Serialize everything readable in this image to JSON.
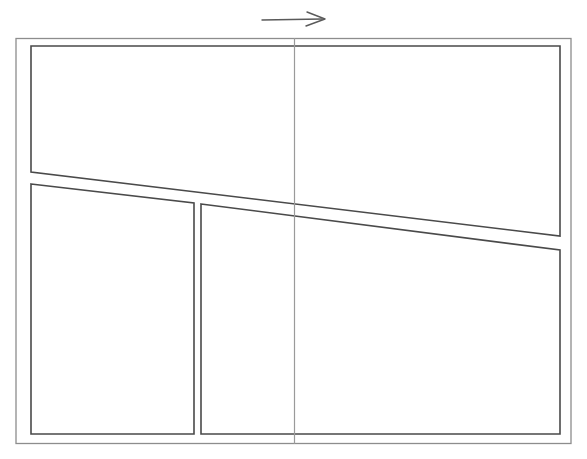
{
  "figure": {
    "title": "Panel layout line diagram",
    "background_color": "#ffffff",
    "line_color": "#4a4a4a",
    "frame_color": "#8d8d8d",
    "center_line_color": "#9a9a9a",
    "width": 587,
    "height": 459
  },
  "annotation": {
    "arrow": {
      "name": "direction-arrow",
      "label": "",
      "direction": "right",
      "start_x": 262,
      "start_y": 20,
      "end_x": 325,
      "end_y": 19,
      "color": "#5a5a5a"
    }
  },
  "outer_frame": {
    "name": "outer-frame",
    "x": 16,
    "y": 38,
    "width": 555,
    "height": 406,
    "color": "#8d8d8d"
  },
  "center_line": {
    "name": "vertical-center-line",
    "x": 294,
    "y_top": 38,
    "y_bottom": 444,
    "color": "#9a9a9a"
  },
  "panels": [
    {
      "id": "upper-panel",
      "name": "upper-panel",
      "shape": "quadrilateral",
      "points": "31,46 560,46 560,236 31,172",
      "color": "#4a4a4a"
    },
    {
      "id": "lower-left-panel",
      "name": "lower-left-panel",
      "shape": "quadrilateral",
      "points": "31,184 194,203 194,434 31,434",
      "color": "#4a4a4a"
    },
    {
      "id": "lower-right-panel",
      "name": "lower-right-panel",
      "shape": "quadrilateral",
      "points": "201,204 560,250 560,434 201,434",
      "color": "#4a4a4a"
    }
  ],
  "dividers": [
    {
      "id": "vertical-divider",
      "name": "lower-panel-divider",
      "x_left": 194,
      "x_right": 201,
      "y_top": 203,
      "y_bottom": 434
    }
  ]
}
